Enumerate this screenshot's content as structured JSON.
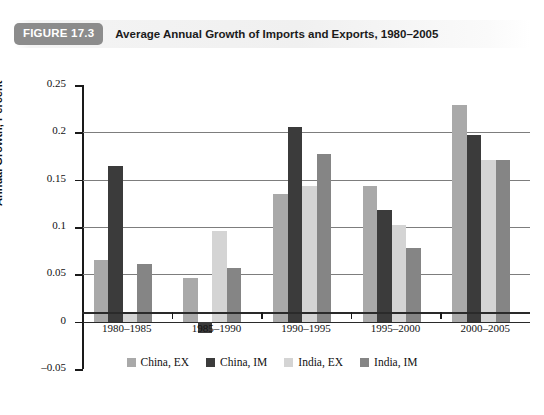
{
  "figure": {
    "badge": "FIGURE 17.3",
    "title": "Average Annual Growth of Imports and Exports, 1980–2005"
  },
  "chart_data": {
    "type": "bar",
    "title": "Average Annual Growth of Imports and Exports, 1980–2005",
    "xlabel": "",
    "ylabel": "Annual Growth, Percent",
    "categories": [
      "1980–1985",
      "1985–1990",
      "1990–1995",
      "1995–2000",
      "2000–2005"
    ],
    "series": [
      {
        "name": "China, EX",
        "color": "#a9a9a9",
        "values": [
          0.065,
          0.046,
          0.135,
          0.143,
          0.229
        ]
      },
      {
        "name": "China, IM",
        "color": "#3b3b3b",
        "values": [
          0.164,
          -0.012,
          0.206,
          0.118,
          0.197
        ]
      },
      {
        "name": "India, EX",
        "color": "#d4d4d4",
        "values": [
          0.008,
          0.096,
          0.143,
          0.102,
          0.171
        ]
      },
      {
        "name": "India, IM",
        "color": "#858585",
        "values": [
          0.061,
          0.057,
          0.177,
          0.078,
          0.171
        ]
      }
    ],
    "ylim": [
      -0.05,
      0.25
    ],
    "yticks": [
      0.25,
      0.2,
      0.15,
      0.1,
      0.05,
      0,
      -0.05
    ],
    "ytick_labels": [
      "0.25",
      "0.2",
      "0.15",
      "0.1",
      "0.05",
      "0",
      "–0.05"
    ],
    "grid": true,
    "legend_position": "bottom"
  }
}
